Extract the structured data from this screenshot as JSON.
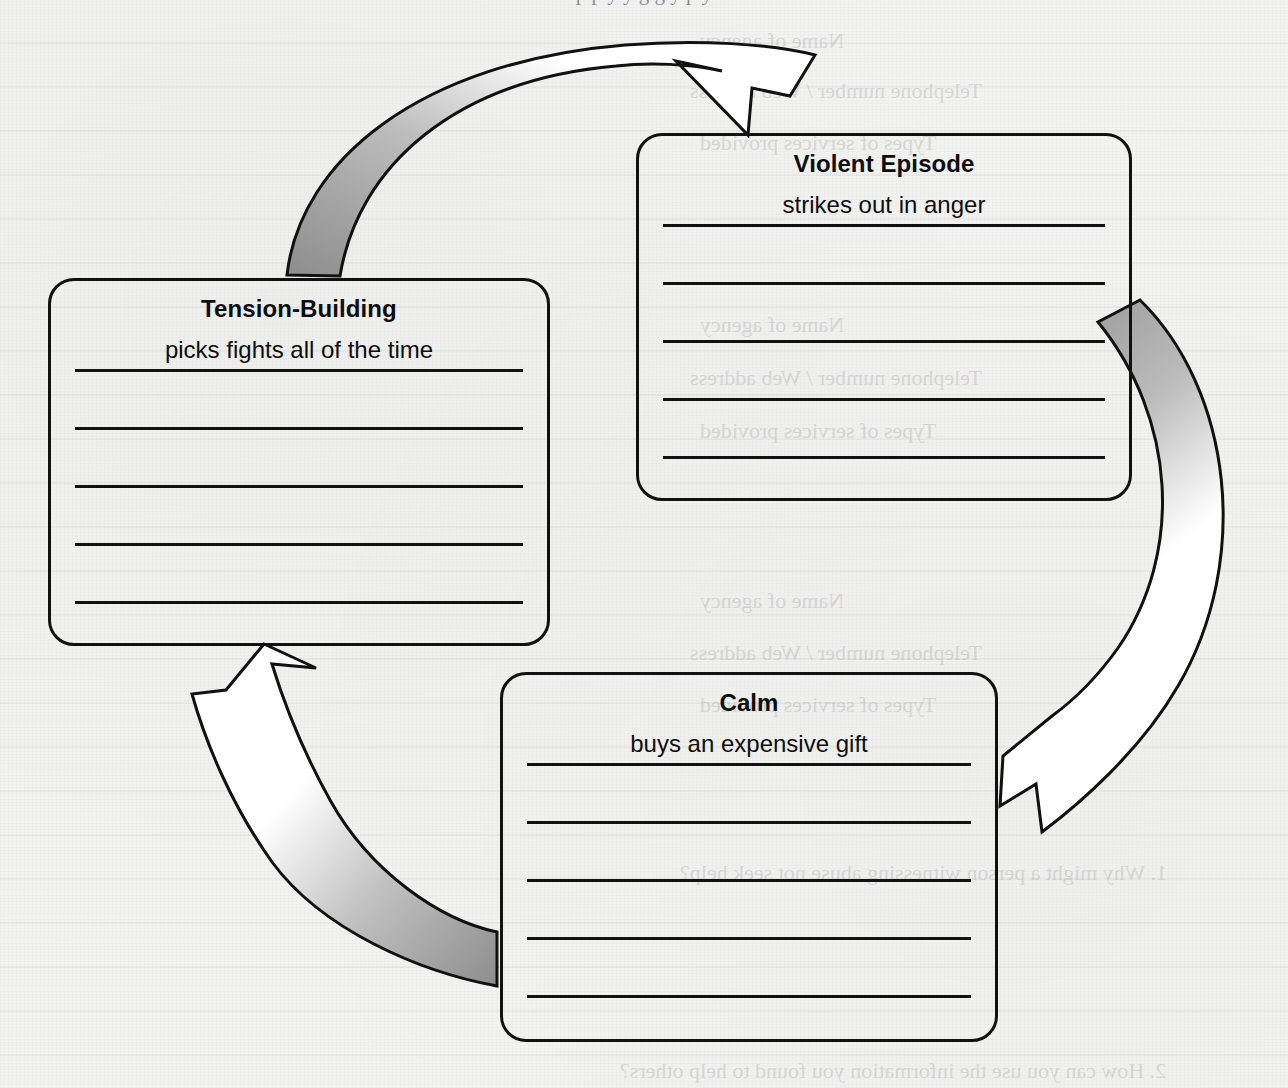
{
  "page": {
    "background_color": "#f3f3f2",
    "ink_color": "#111111",
    "arrow_fill_dark": "#9a9a9a",
    "arrow_fill_light": "#ffffff",
    "clipped_heading_descenders": "p p y y g g y p y"
  },
  "diagram": {
    "type": "cycle",
    "stages": [
      {
        "id": "tension-building",
        "title": "Tension-Building",
        "entry": "picks fights all of the time",
        "blank_lines": 5
      },
      {
        "id": "violent-episode",
        "title": "Violent Episode",
        "entry": "strikes out in anger",
        "blank_lines": 5
      },
      {
        "id": "calm",
        "title": "Calm",
        "entry": "buys an expensive gift",
        "blank_lines": 5
      }
    ],
    "arrows": [
      {
        "id": "arrow-tension-to-violent",
        "from": "tension-building",
        "to": "violent-episode",
        "direction": "clockwise-top"
      },
      {
        "id": "arrow-violent-to-calm",
        "from": "violent-episode",
        "to": "calm",
        "direction": "clockwise-right"
      },
      {
        "id": "arrow-calm-to-tension",
        "from": "calm",
        "to": "tension-building",
        "direction": "clockwise-bottom-left"
      }
    ]
  },
  "bleed_through": {
    "note": "faint mirrored text showing through from the reverse side of the page",
    "lines": [
      {
        "text": "Name of agency",
        "x": 700,
        "y": 28,
        "size": 22,
        "font": "serif"
      },
      {
        "text": "Telephone number / Web address",
        "x": 690,
        "y": 78,
        "size": 22,
        "font": "serif"
      },
      {
        "text": "Types of services provided",
        "x": 700,
        "y": 130,
        "size": 22,
        "font": "serif"
      },
      {
        "text": "Name of agency",
        "x": 700,
        "y": 312,
        "size": 22,
        "font": "serif"
      },
      {
        "text": "Telephone number / Web address",
        "x": 690,
        "y": 365,
        "size": 22,
        "font": "serif"
      },
      {
        "text": "Types of services provided",
        "x": 700,
        "y": 418,
        "size": 22,
        "font": "serif"
      },
      {
        "text": "Name of agency",
        "x": 700,
        "y": 588,
        "size": 22,
        "font": "serif"
      },
      {
        "text": "Telephone number / Web address",
        "x": 690,
        "y": 640,
        "size": 22,
        "font": "serif"
      },
      {
        "text": "Types of services provided",
        "x": 700,
        "y": 692,
        "size": 22,
        "font": "serif"
      },
      {
        "text": "1. Why might a person witnessing abuse not seek help?",
        "x": 680,
        "y": 860,
        "size": 22,
        "font": "serif"
      },
      {
        "text": "2. How can you use the information you found to help others?",
        "x": 620,
        "y": 1058,
        "size": 22,
        "font": "serif"
      }
    ]
  }
}
